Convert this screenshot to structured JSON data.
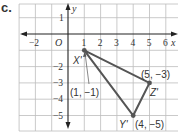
{
  "problem_label": "c.",
  "graph": {
    "x_axis_label": "x",
    "y_axis_label": "y",
    "origin_label": "O",
    "x_ticks": [
      "-2",
      "1",
      "2",
      "3",
      "4",
      "5",
      "6"
    ],
    "y_ticks": [
      "1",
      "-2",
      "-3",
      "-4",
      "-5"
    ],
    "grid_x_range": [
      -3,
      6.6
    ],
    "grid_y_range": [
      -5.8,
      1.8
    ]
  },
  "triangle": {
    "color": "#555555",
    "vertices": [
      {
        "name": "X'",
        "x": 1,
        "y": -1,
        "coord_label": "(1, −1)"
      },
      {
        "name": "Y'",
        "x": 4,
        "y": -5,
        "coord_label": "(4, −5)"
      },
      {
        "name": "Z'",
        "x": 5,
        "y": -3,
        "coord_label": "(5, −3)"
      }
    ]
  },
  "labels": {
    "x_prime": "X'",
    "y_prime": "Y'",
    "z_prime": "Z'",
    "x_coord": "(1, −1)",
    "y_coord": "(4, −5)",
    "z_coord": "(5, −3)",
    "tick_neg2": "−2",
    "tick_x1": "1",
    "tick_x2": "2",
    "tick_x3": "3",
    "tick_x4": "4",
    "tick_x5": "5",
    "tick_x6": "6",
    "tick_y1": "1",
    "tick_yneg2": "−2",
    "tick_yneg3": "−3",
    "tick_yneg4": "−4",
    "tick_yneg5": "−5"
  }
}
